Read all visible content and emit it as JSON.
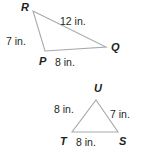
{
  "figure": {
    "stroke_color": "#a7a9ac",
    "text_color": "#231f20",
    "background_color": "#ffffff",
    "units": "in.",
    "shapes": [
      {
        "name": "triangle-pqr",
        "vertices": [
          {
            "label": "R",
            "x": 33,
            "y": 11
          },
          {
            "label": "Q",
            "x": 106,
            "y": 47
          },
          {
            "label": "P",
            "x": 45,
            "y": 51
          }
        ],
        "sides": [
          {
            "name": "RQ",
            "length": "12 in."
          },
          {
            "name": "RP",
            "length": "7 in."
          },
          {
            "name": "PQ",
            "length": "8 in."
          }
        ]
      },
      {
        "name": "triangle-stu",
        "vertices": [
          {
            "label": "U",
            "x": 96,
            "y": 100
          },
          {
            "label": "S",
            "x": 118,
            "y": 132
          },
          {
            "label": "T",
            "x": 72,
            "y": 132
          }
        ],
        "sides": [
          {
            "name": "TU",
            "length": "8 in."
          },
          {
            "name": "US",
            "length": "7 in."
          },
          {
            "name": "TS",
            "length": "8 in."
          }
        ]
      }
    ],
    "labels": {
      "r_vertex": "R",
      "q_vertex": "Q",
      "p_vertex": "P",
      "rq_side": "12 in.",
      "rp_side": "7 in.",
      "pq_side": "8 in.",
      "u_vertex": "U",
      "s_vertex": "S",
      "t_vertex": "T",
      "tu_side": "8 in.",
      "us_side": "7 in.",
      "ts_side": "8 in."
    }
  }
}
